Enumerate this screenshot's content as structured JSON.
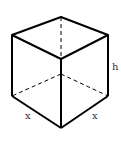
{
  "diagram": {
    "type": "cube",
    "labels": {
      "height": "h",
      "base_left": "x",
      "base_right": "x"
    },
    "colors": {
      "edge": "#000000",
      "label": "#333333",
      "background": "#ffffff"
    }
  }
}
